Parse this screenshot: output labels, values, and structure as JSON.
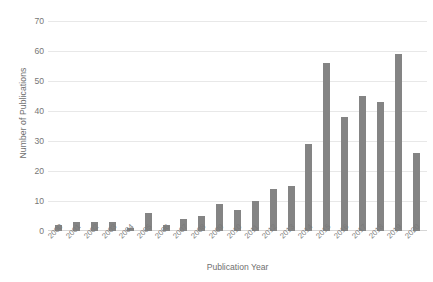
{
  "chart_data": {
    "type": "bar",
    "title": "",
    "xlabel": "Publication Year",
    "ylabel": "Number of Publications",
    "categories": [
      "2000",
      "2001",
      "2002",
      "2003",
      "2004",
      "2005",
      "2006",
      "2007",
      "2008",
      "2009",
      "2010",
      "2011",
      "2012",
      "2013",
      "2014",
      "2015",
      "2016",
      "2017",
      "2018",
      "2019",
      "2020"
    ],
    "values": [
      2,
      3,
      3,
      3,
      1,
      6,
      2,
      4,
      5,
      9,
      7,
      10,
      14,
      15,
      29,
      56,
      38,
      45,
      43,
      59,
      26
    ],
    "ylim": [
      0,
      70
    ],
    "yticks": [
      0,
      10,
      20,
      30,
      40,
      50,
      60,
      70
    ],
    "ytick_labels": [
      "0",
      "10",
      "20",
      "30",
      "40",
      "50",
      "60",
      "70"
    ],
    "grid": "horizontal",
    "legend": "none",
    "bar_color": "#848484",
    "gridline_color": "#e8e8e8",
    "background_color": "#ffffff",
    "text_color": "#707070"
  }
}
